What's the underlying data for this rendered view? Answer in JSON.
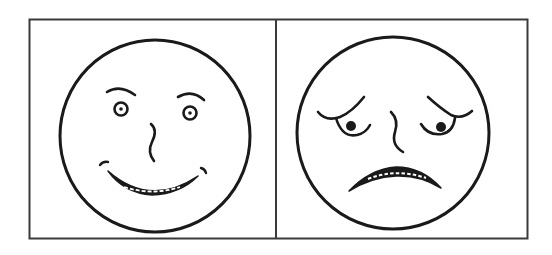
{
  "figure": {
    "description": "Two cartoon faces side by side in a bordered box",
    "panels": [
      {
        "id": "left",
        "label": "happy-face",
        "expression": "happy"
      },
      {
        "id": "right",
        "label": "sad-face",
        "expression": "sad"
      }
    ],
    "colors": {
      "ink": "#1a1a1a",
      "frame": "#3a3a3a",
      "background": "#ffffff"
    }
  }
}
